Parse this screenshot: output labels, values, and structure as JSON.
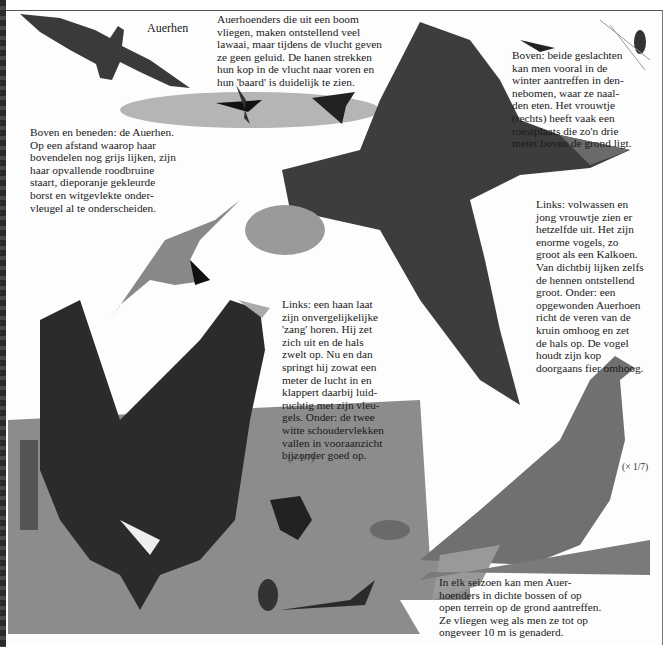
{
  "page": {
    "title": "Auerhen",
    "captions": {
      "flight_noise": "Auerhoenders die uit een boom\nvliegen, maken ontstellend veel\nlawaai, maar tijdens de vlucht geven\nze geen geluid. De hanen strekken\nhun kop in de vlucht naar voren en\nhun 'baard' is duidelijk te zien.",
      "winter_pines": "Boven: beide geslachten\nkan men vooral in de\nwinter aantreffen in den-\nnebomen, waar ze naal-\nden eten. Het vrouwtje\n(rechts) heeft vaak een\nroestplaats die zo'n drie\nmeter boven de grond ligt.",
      "above_below": "Boven en beneden: de Auerhen.\nOp een afstand waarop haar\nbovendelen nog grijs lijken, zijn\nhaar opvallende roodbruine\nstaart, dieporanje gekleurde\nborst en witgevlekte onder-\nvleugel al te onderscheiden.",
      "female_size": "Links: volwassen en\njong vrouwtje zien er\nhetzelfde uit. Het zijn\nenorme vogels, zo\ngroot als een Kalkoen.\nVan dichtbij lijken zelfs\nde hennen ontstellend\ngroot. Onder: een\nopgewonden Auerhoen\nricht de veren van de\nkruin omhoog en zet\nde hals op. De vogel\nhoudt zijn kop\ndoorgaans fier omhoog.",
      "male_song": "Links: een haan laat\nzijn onvergelijkelijke\n'zang' horen. Hij zet\nzich uit en de hals\nzwelt op. Nu en dan\nspringt hij zowat een\nmeter de lucht in en\nklappert daarbij luid-\nruchtig met zijn vleu-\ngels. Onder: de twee\nwitte schoudervlekken\nvallen in vooraanzicht\nbijzonder goed op.",
      "all_seasons": "In elk seizoen kan men Auer-\nhoenders in dichte bossen of op\nopen terrein op de grond aantreffen.\nZe vliegen weg als men ze tot op\nongeveer 10 m is genaderd."
    },
    "scale_labels": {
      "male": "(× 1/7)",
      "female": "(× 1/7)"
    }
  },
  "colors": {
    "ink": "#1a1a1a",
    "paper": "#fdfdfd",
    "plumage_dark": "#2b2b2b",
    "plumage_mid": "#6b6b6b",
    "foliage": "#9a9a9a",
    "ground": "#8c8c8c"
  }
}
